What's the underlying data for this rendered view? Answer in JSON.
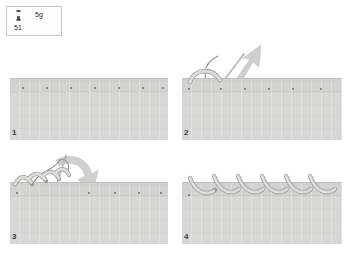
{
  "page": {
    "background": "#ffffff",
    "width": 350,
    "height": 253
  },
  "legend": {
    "icon_name": "thread-spool-icon",
    "size_label": "5g",
    "code_label": "51",
    "border_color": "#c9c9c9"
  },
  "colors": {
    "fabric": "#d7d7d5",
    "fabric_band": "#d2d2d0",
    "edge_line": "#bdbdbb",
    "dot": "#6e6e6e",
    "thread": "#8f8f8d",
    "needle": "#9a9a98",
    "arrow": "#c2c2c0",
    "number": "#3a3a3a"
  },
  "panels": [
    {
      "number": "1",
      "caption": "Mark evenly spaced entry points along the fabric edge",
      "dot_count": 7,
      "stitch_count": 0,
      "has_needle": false,
      "has_arrow": false
    },
    {
      "number": "2",
      "caption": "Bring needle up and pull thread through the first loop",
      "dot_count": 6,
      "stitch_count": 1,
      "has_needle": true,
      "has_arrow": true,
      "arrow_direction": "up-right"
    },
    {
      "number": "3",
      "caption": "Continue looping the thread and insert the needle downward",
      "dot_count": 5,
      "stitch_count": 4,
      "has_needle": true,
      "has_arrow": true,
      "arrow_direction": "down-right"
    },
    {
      "number": "4",
      "caption": "Completed row of blanket stitch arcs",
      "dot_count": 1,
      "stitch_count": 6,
      "has_needle": false,
      "has_arrow": false
    }
  ]
}
